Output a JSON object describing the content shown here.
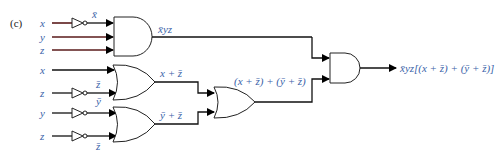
{
  "figure": {
    "part_label": "(c)",
    "inputs": {
      "group1": [
        "x",
        "y",
        "z"
      ],
      "group2": [
        "x",
        "z"
      ],
      "group3": [
        "y",
        "z"
      ]
    },
    "inverter_outputs": {
      "x_bar": "x̄",
      "z_bar_1": "z̄",
      "y_bar": "ȳ",
      "z_bar_2": "z̄"
    },
    "gate_outputs": {
      "and1": "x̄yz",
      "or1": "x + z̄",
      "or2": "ȳ + z̄",
      "or3": "(x + z̄) + (ȳ + z̄)",
      "final": "x̄yz[(x + z̄) + (ȳ + z̄)]"
    },
    "gates": [
      "AND",
      "OR",
      "OR",
      "OR",
      "AND"
    ],
    "colors": {
      "label": "#3a62a8",
      "wire": "#111111"
    }
  }
}
